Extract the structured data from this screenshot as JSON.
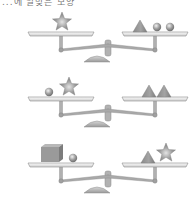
{
  "caption": "...에 알맞은 모양",
  "colors": {
    "shape_fill": "#9a9a9a",
    "shape_highlight": "#d8d8d8",
    "pan": "#e6e6e6",
    "pan_edge": "#8c8c8c",
    "beam": "#a8a8a8",
    "base": "#b4b4b4"
  },
  "scales": [
    {
      "label": "scale-1",
      "left_pan": [
        "star"
      ],
      "right_pan": [
        "triangle",
        "sphere",
        "sphere"
      ]
    },
    {
      "label": "scale-2",
      "left_pan": [
        "sphere",
        "star"
      ],
      "right_pan": [
        "triangle",
        "triangle"
      ]
    },
    {
      "label": "scale-3",
      "left_pan": [
        "cube",
        "sphere"
      ],
      "right_pan": [
        "triangle",
        "star"
      ]
    }
  ]
}
